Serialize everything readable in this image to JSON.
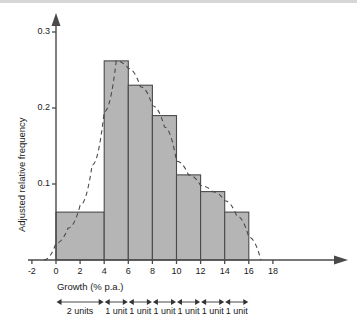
{
  "chart_data": {
    "type": "bar",
    "title": "",
    "subtitle": "",
    "xlabel": "Growth (% p.a.)",
    "ylabel": "Adjusted relative frequency",
    "xlim": [
      -3,
      19
    ],
    "ylim": [
      0,
      0.32
    ],
    "grid": false,
    "legend": null,
    "xticks": [
      "-2",
      "0",
      "2",
      "4",
      "6",
      "8",
      "10",
      "12",
      "14",
      "16",
      "18"
    ],
    "xtick_values": [
      -2,
      0,
      2,
      4,
      6,
      8,
      10,
      12,
      14,
      16,
      18
    ],
    "yticks": [
      "0.3",
      "0.2",
      "0.1"
    ],
    "ytick_values": [
      0.3,
      0.2,
      0.1
    ],
    "bins": [
      {
        "left": 0,
        "right": 4,
        "value": 0.063,
        "width_units": "2 units"
      },
      {
        "left": 4,
        "right": 6,
        "value": 0.262,
        "width_units": "1 unit"
      },
      {
        "left": 6,
        "right": 8,
        "value": 0.23,
        "width_units": "1 unit"
      },
      {
        "left": 8,
        "right": 10,
        "value": 0.19,
        "width_units": "1 unit"
      },
      {
        "left": 10,
        "right": 12,
        "value": 0.112,
        "width_units": "1 unit"
      },
      {
        "left": 12,
        "right": 14,
        "value": 0.09,
        "width_units": "1 unit"
      },
      {
        "left": 14,
        "right": 16,
        "value": 0.063,
        "width_units": "1 unit"
      }
    ],
    "categories": [
      "0-4",
      "4-6",
      "6-8",
      "8-10",
      "10-12",
      "12-14",
      "14-16"
    ],
    "values": [
      0.063,
      0.262,
      0.23,
      0.19,
      0.112,
      0.09,
      0.063
    ],
    "overlay_curve": {
      "style": "dashed",
      "name": "smoothed density curve",
      "points": [
        {
          "x": -1.0,
          "y": 0.0
        },
        {
          "x": 0.0,
          "y": 0.022
        },
        {
          "x": 1.0,
          "y": 0.042
        },
        {
          "x": 2.0,
          "y": 0.072
        },
        {
          "x": 3.0,
          "y": 0.125
        },
        {
          "x": 4.0,
          "y": 0.195
        },
        {
          "x": 5.0,
          "y": 0.262
        },
        {
          "x": 6.0,
          "y": 0.252
        },
        {
          "x": 7.0,
          "y": 0.228
        },
        {
          "x": 8.0,
          "y": 0.203
        },
        {
          "x": 9.0,
          "y": 0.175
        },
        {
          "x": 10.0,
          "y": 0.13
        },
        {
          "x": 11.0,
          "y": 0.112
        },
        {
          "x": 12.0,
          "y": 0.098
        },
        {
          "x": 13.0,
          "y": 0.09
        },
        {
          "x": 14.0,
          "y": 0.078
        },
        {
          "x": 15.0,
          "y": 0.058
        },
        {
          "x": 16.0,
          "y": 0.03
        },
        {
          "x": 17.0,
          "y": 0.0
        }
      ]
    },
    "colors": {
      "bar_fill": "#b5b5b5",
      "bar_stroke": "#4a4a4a",
      "axis": "#4a4a4a",
      "curve": "#4a4a4a",
      "text": "#1a1a1a"
    }
  },
  "unit_annotations": [
    {
      "label": "2 units",
      "from": 0,
      "to": 4
    },
    {
      "label": "1 unit",
      "from": 4,
      "to": 6
    },
    {
      "label": "1 unit",
      "from": 6,
      "to": 8
    },
    {
      "label": "1 unit",
      "from": 8,
      "to": 10
    },
    {
      "label": "1 unit",
      "from": 10,
      "to": 12
    },
    {
      "label": "1 unit",
      "from": 12,
      "to": 14
    },
    {
      "label": "1 unit",
      "from": 14,
      "to": 16
    }
  ]
}
